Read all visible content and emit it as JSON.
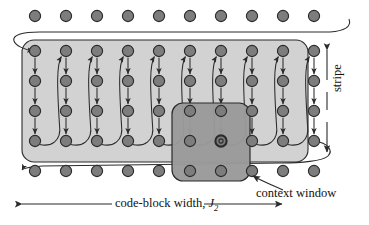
{
  "figure": {
    "type": "diagram",
    "labels": {
      "stripe": "stripe",
      "context_window": "context window",
      "codeblock_width_prefix": "code-block width, ",
      "codeblock_width_symbol": "J",
      "codeblock_width_subscript": "2"
    },
    "grid": {
      "columns": 10,
      "rows_in_stripe": 4,
      "top_row_dots": 10,
      "bottom_row_dots": 10,
      "col_start_x": 35,
      "col_spacing": 31,
      "stripe_row_ys": [
        51,
        81,
        111,
        141
      ],
      "top_row_y": 16,
      "bottom_row_y": 171,
      "dot_radius": 5.6
    },
    "stripe_box": {
      "x": 22,
      "y": 40,
      "width": 286,
      "height": 122,
      "radius": 12
    },
    "context_window_box": {
      "x": 172,
      "y": 103,
      "width": 78,
      "height": 78,
      "radius": 11
    },
    "current_coefficient": {
      "column_index": 6,
      "row_index": 3
    },
    "context_window_columns": [
      5,
      6,
      7
    ],
    "colors": {
      "stripe_fill": "#d2d2d2",
      "context_fill": "#9a9a9a",
      "dot_fill": "#7d7d7d",
      "dot_stroke": "#2b2b2b",
      "line": "#2b2b2b",
      "text": "#111111",
      "background": "#ffffff"
    },
    "arrows": {
      "stripe_measure": "double-headed vertical arrow on right side",
      "codeblock_measure": "double-headed horizontal arrow along bottom",
      "context_pointer": "arrow pointing up-left from label to context window corner",
      "scan_direction": "down each column, then wrap to top of next column right"
    }
  }
}
